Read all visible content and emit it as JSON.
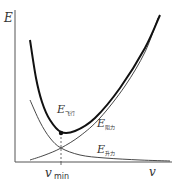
{
  "chart_data": {
    "type": "line",
    "title": "",
    "xlabel": "v",
    "ylabel": "E",
    "grid": false,
    "legend": "inline labels",
    "x_tick_labels": [
      {
        "label": "v",
        "sub": "min",
        "note": "position of minimum total energy"
      }
    ],
    "series": [
      {
        "name": "E_飞行",
        "label_main": "E",
        "label_sub": "飞行",
        "label_sub_confidence": "inferred from context; glyphs too blurred to read directly",
        "role": "total energy (sum)",
        "style": "thick",
        "shape": "U-shaped, minimum at v_min",
        "points_px": [
          [
            30,
            40
          ],
          [
            36,
            78
          ],
          [
            42,
            102
          ],
          [
            50,
            120
          ],
          [
            61,
            132
          ],
          [
            75,
            131
          ],
          [
            95,
            118
          ],
          [
            120,
            88
          ],
          [
            145,
            48
          ],
          [
            160,
            15
          ]
        ]
      },
      {
        "name": "E_阻力",
        "label_main": "E",
        "label_sub": "阻力",
        "label_sub_confidence": "inferred from context; glyphs too blurred to read directly",
        "role": "drag term (increasing)",
        "style": "thin",
        "points_px": [
          [
            30,
            160
          ],
          [
            45,
            155
          ],
          [
            61,
            148
          ],
          [
            80,
            136
          ],
          [
            100,
            118
          ],
          [
            125,
            86
          ],
          [
            145,
            52
          ],
          [
            158,
            18
          ]
        ]
      },
      {
        "name": "E_升力",
        "label_main": "E",
        "label_sub": "升力",
        "label_sub_confidence": "inferred from context; glyphs too blurred to read directly",
        "role": "lift term (decreasing)",
        "style": "thin",
        "points_px": [
          [
            30,
            100
          ],
          [
            40,
            122
          ],
          [
            50,
            138
          ],
          [
            61,
            148
          ],
          [
            80,
            155
          ],
          [
            105,
            158
          ],
          [
            140,
            160
          ],
          [
            170,
            161
          ]
        ]
      }
    ],
    "annotations": [
      {
        "type": "point",
        "at": "minimum of E_飞行",
        "x_px": 61,
        "y_px": 133
      },
      {
        "type": "dashed-drop-line",
        "x_px": 61,
        "from_y_px": 133,
        "to_y_px": 162
      }
    ]
  },
  "labels": {
    "y_axis": "E",
    "x_axis": "v",
    "vmin_main": "v",
    "vmin_sub": "min",
    "total_main": "E",
    "total_sub": "飞行",
    "drag_main": "E",
    "drag_sub": "阻力",
    "lift_main": "E",
    "lift_sub": "升力"
  }
}
